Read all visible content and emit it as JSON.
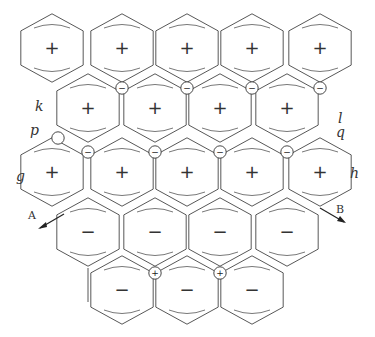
{
  "figure": {
    "hex_radius": 36,
    "rows": [
      {
        "y": 48,
        "xs": [
          52,
          122,
          187,
          252,
          320
        ],
        "sign": "+"
      },
      {
        "y": 108,
        "xs": [
          88,
          155,
          220,
          287
        ],
        "sign": "+"
      },
      {
        "y": 172,
        "xs": [
          52,
          122,
          187,
          252,
          320
        ],
        "sign": "+"
      },
      {
        "y": 232,
        "xs": [
          88,
          155,
          220,
          287
        ],
        "sign": "−"
      },
      {
        "y": 290,
        "xs": [
          122,
          187,
          252
        ],
        "sign": "−"
      }
    ],
    "wheel_signs": [
      {
        "x": 122,
        "y": 88,
        "sign": "−"
      },
      {
        "x": 187,
        "y": 88,
        "sign": "−"
      },
      {
        "x": 252,
        "y": 88,
        "sign": "−"
      },
      {
        "x": 320,
        "y": 88,
        "sign": "−"
      },
      {
        "x": 88,
        "y": 152,
        "sign": "−"
      },
      {
        "x": 155,
        "y": 152,
        "sign": "−"
      },
      {
        "x": 220,
        "y": 152,
        "sign": "−"
      },
      {
        "x": 287,
        "y": 152,
        "sign": "−"
      },
      {
        "x": 155,
        "y": 273,
        "sign": "+"
      },
      {
        "x": 220,
        "y": 273,
        "sign": "+"
      }
    ]
  },
  "labels": {
    "k": "k",
    "l": "l",
    "p": "p",
    "q": "q",
    "g": "g",
    "h": "h",
    "A": "A",
    "B": "B"
  },
  "colors": {
    "ink": "#333333",
    "background": "#ffffff"
  }
}
